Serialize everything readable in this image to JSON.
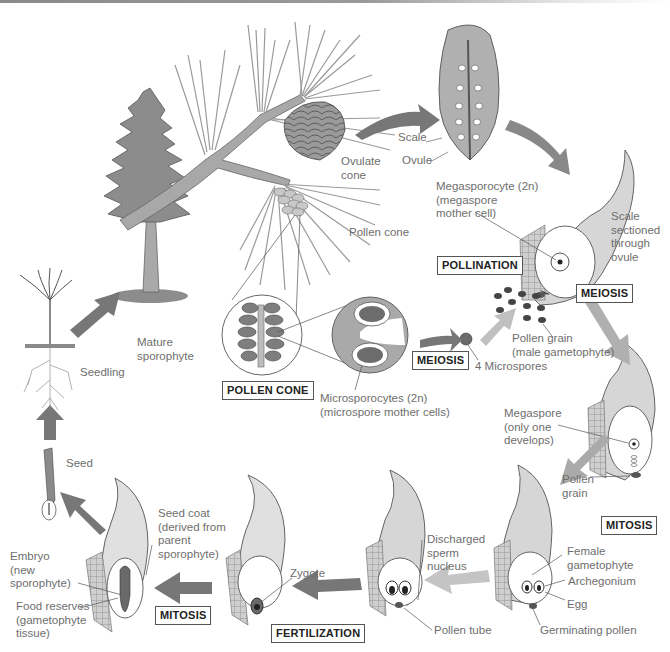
{
  "colors": {
    "tree_fill": "#8c8c8c",
    "branch_fill": "#a8a8a8",
    "arrow_dark": "#777777",
    "arrow_light": "#b8b8b8",
    "ovule_fill": "#dcdcdc",
    "label_text": "#6e6e6e",
    "box_border": "#555555"
  },
  "stage_boxes": {
    "pollination": "POLLINATION",
    "meiosis_mega": "MEIOSIS",
    "meiosis_micro": "MEIOSIS",
    "pollen_cone": "POLLEN CONE",
    "mitosis_female": "MITOSIS",
    "fertilization": "FERTILIZATION",
    "mitosis_embryo": "MITOSIS"
  },
  "labels": {
    "scale": "Scale",
    "ovule": "Ovule",
    "ovulate_cone": "Ovulate\ncone",
    "pollen_cone": "Pollen cone",
    "megasporocyte": "Megasporocyte (2n)\n(megaspore\nmother cell)",
    "scale_sectioned": "Scale\nsectioned\nthrough\novule",
    "mature_sporophyte": "Mature\nsporophyte",
    "seedling": "Seedling",
    "microsporocytes": "Microsporocytes (2n)\n(microspore mother cells)",
    "four_microspores": "4 Microspores",
    "pollen_grain_male": "Pollen grain\n(male gametophyte)",
    "megaspore": "Megaspore\n(only one\ndevelops)",
    "pollen_grain": "Pollen\ngrain",
    "female_gametophyte": "Female\ngametophyte",
    "archegonium": "Archegonium",
    "egg": "Egg",
    "germinating_pollen": "Germinating pollen",
    "discharged_sperm": "Discharged\nsperm\nnucleus",
    "pollen_tube": "Pollen tube",
    "zygote": "Zygote",
    "seed_coat": "Seed coat\n(derived from\nparent\nsporophyte)",
    "embryo": "Embryo\n(new\nsporophyte)",
    "food_reserves": "Food reserves\n(gametophyte\ntissue)",
    "seed": "Seed"
  }
}
